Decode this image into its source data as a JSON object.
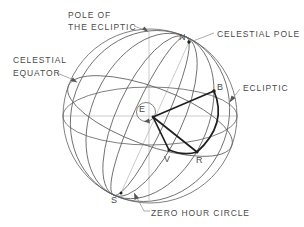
{
  "diagram": {
    "labels": {
      "pole_of_ecliptic_line1": "POLE OF",
      "pole_of_ecliptic_line2": "THE ECLIPTIC",
      "celestial_pole": "CELESTIAL POLE",
      "celestial_equator_line1": "CELESTIAL",
      "celestial_equator_line2": "EQUATOR",
      "ecliptic": "ECLIPTIC",
      "zero_hour_circle": "ZERO HOUR CIRCLE"
    },
    "points": {
      "north_celestial_pole": "N",
      "earth": "E",
      "body": "B",
      "vernal_equinox": "V",
      "equator_foot": "R",
      "south_celestial_pole": "S"
    },
    "colors": {
      "background": "#ffffff",
      "main_line": "#5f5f5f",
      "construction_line": "#b5b5b5",
      "emphasis_line": "#1f1f1f",
      "text": "#4a4a4a"
    }
  }
}
